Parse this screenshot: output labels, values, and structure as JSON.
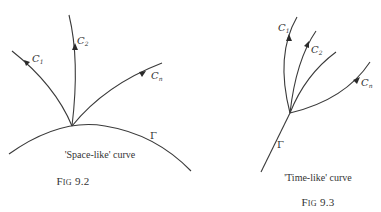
{
  "figures": [
    {
      "id": "fig-9-2",
      "caption": "'Space-like' curve",
      "fig_prefix_big": "F",
      "fig_prefix_small": "IG",
      "fig_number": "9.2",
      "curve_label": "Γ",
      "characteristics": [
        {
          "letter": "C",
          "sub": "1"
        },
        {
          "letter": "C",
          "sub": "2"
        },
        {
          "letter": "C",
          "sub": "n"
        }
      ]
    },
    {
      "id": "fig-9-3",
      "caption": "'Time-like' curve",
      "fig_prefix_big": "F",
      "fig_prefix_small": "IG",
      "fig_number": "9.3",
      "curve_label": "Γ",
      "characteristics": [
        {
          "letter": "C",
          "sub": "1"
        },
        {
          "letter": "C",
          "sub": "2"
        },
        {
          "letter": "C",
          "sub": "n"
        }
      ]
    }
  ],
  "colors": {
    "stroke": "#3a3a3a",
    "text": "#333333",
    "background": "#ffffff"
  }
}
